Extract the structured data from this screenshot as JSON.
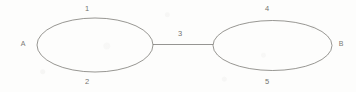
{
  "diagram": {
    "type": "undirected-graph",
    "background_color": "#fdfdfc",
    "stroke_color": "#6f6e69",
    "label_color": "#5d5c58",
    "nodes": [
      {
        "id": "A",
        "label": "A",
        "x": 22,
        "y": 44
      },
      {
        "id": "B",
        "label": "B",
        "x": 341,
        "y": 44
      }
    ],
    "shapes": [
      {
        "name": "left-ellipse",
        "kind": "ellipse",
        "cx": 95,
        "cy": 45,
        "rx": 58,
        "ry": 27
      },
      {
        "name": "right-ellipse",
        "kind": "ellipse",
        "cx": 272.5,
        "cy": 45.5,
        "rx": 59.5,
        "ry": 25
      },
      {
        "name": "bridge-line",
        "kind": "line",
        "x1": 153,
        "y1": 44.5,
        "x2": 213,
        "y2": 44.5
      }
    ],
    "edge_labels": [
      {
        "id": "1",
        "label": "1",
        "x": 87,
        "y": 6,
        "belongs_to": "left-ellipse-top"
      },
      {
        "id": "2",
        "label": "2",
        "x": 87,
        "y": 79,
        "belongs_to": "left-ellipse-bottom"
      },
      {
        "id": "3",
        "label": "3",
        "x": 180,
        "y": 31,
        "belongs_to": "bridge-line"
      },
      {
        "id": "4",
        "label": "4",
        "x": 267,
        "y": 6,
        "belongs_to": "right-ellipse-top"
      },
      {
        "id": "5",
        "label": "5",
        "x": 267,
        "y": 79,
        "belongs_to": "right-ellipse-bottom"
      }
    ]
  }
}
